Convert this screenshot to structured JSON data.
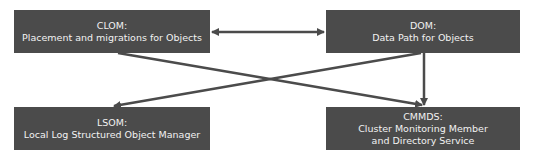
{
  "diagram": {
    "nodes": {
      "clom": {
        "title": "CLOM:",
        "lines": [
          "Placement and migrations for Objects"
        ]
      },
      "dom": {
        "title": "DOM:",
        "lines": [
          "Data Path for Objects"
        ]
      },
      "lsom": {
        "title": "LSOM:",
        "lines": [
          "Local Log Structured Object Manager"
        ]
      },
      "cmmds": {
        "title": "CMMDS:",
        "lines": [
          "Cluster Monitoring Member",
          "and Directory Service"
        ]
      }
    },
    "edges": [
      {
        "from": "clom",
        "to": "dom",
        "type": "bidirectional"
      },
      {
        "from": "clom",
        "to": "cmmds",
        "type": "directed"
      },
      {
        "from": "dom",
        "to": "lsom",
        "type": "directed"
      },
      {
        "from": "dom",
        "to": "cmmds",
        "type": "directed"
      }
    ],
    "colors": {
      "box_fill": "#4b4b4b",
      "box_text": "#f2f2f2",
      "arrow": "#4b4b4b",
      "background": "#ffffff"
    }
  }
}
